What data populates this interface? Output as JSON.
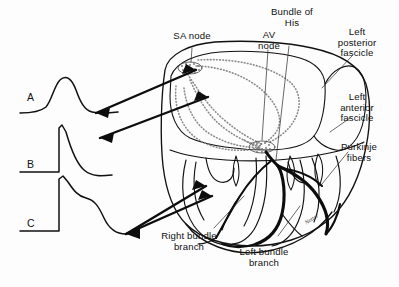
{
  "figure": {
    "background_color": "#fdfdfd",
    "ink_color": "#111111",
    "stipple_color": "#8a8a8a"
  },
  "tracings": [
    {
      "id": "A",
      "label": "A",
      "description": "rounded monophasic action potential upstroke"
    },
    {
      "id": "B",
      "label": "B",
      "description": "fast upstroke with slow repolarization"
    },
    {
      "id": "C",
      "label": "C",
      "description": "fast upstroke with plateau and slow decline"
    }
  ],
  "labels": [
    {
      "name": "sa-node",
      "text": "SA node"
    },
    {
      "name": "av-node",
      "text": "AV\nnode"
    },
    {
      "name": "bundle-of-his",
      "text": "Bundle of\nHis"
    },
    {
      "name": "left-posterior-fascicle",
      "text": "Left\nposterior\nfascicle"
    },
    {
      "name": "left-anterior-fascicle",
      "text": "Left\nanterior\nfascicle"
    },
    {
      "name": "purkinje-fibers",
      "text": "Purkinje\nfibers"
    },
    {
      "name": "right-bundle-branch",
      "text": "Right bundle\nbranch"
    },
    {
      "name": "left-bundle-branch",
      "text": "Left bundle\nbranch"
    }
  ],
  "signature": {
    "text": "Netter"
  }
}
